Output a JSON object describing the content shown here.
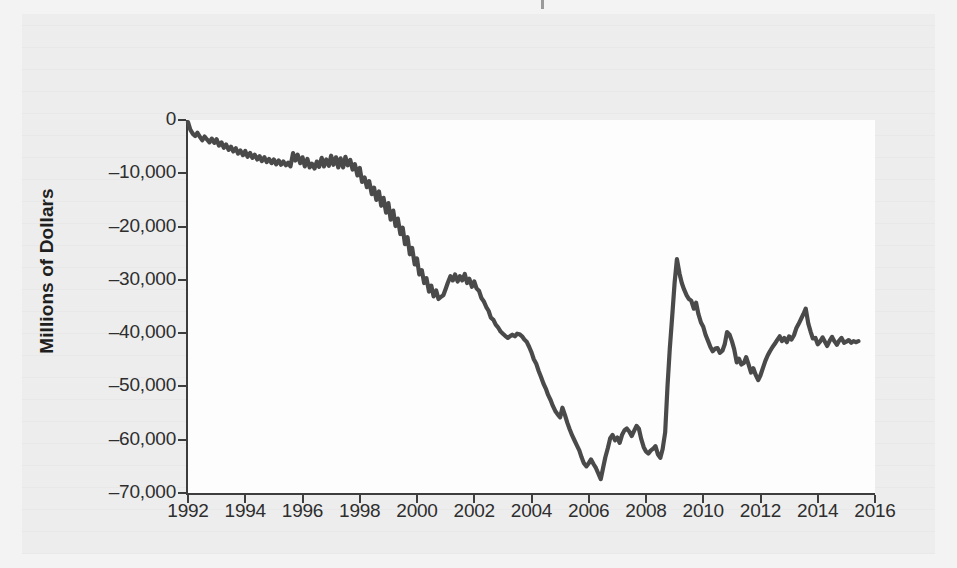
{
  "figure": {
    "background_color": "#ededed",
    "plot_background_color": "#fdfdfd",
    "line_color": "#4a4a4a",
    "axis_color": "#3d3d3d",
    "y_axis_title": "Millions of Dollars"
  },
  "axes": {
    "y_ticks": [
      "0",
      "–10,000",
      "–20,000",
      "–30,000",
      "–40,000",
      "–50,000",
      "–60,000",
      "–70,000"
    ],
    "x_ticks": [
      "1992",
      "1994",
      "1996",
      "1998",
      "2000",
      "2002",
      "2004",
      "2006",
      "2008",
      "2010",
      "2012",
      "2014",
      "2016"
    ]
  },
  "chart_data": {
    "type": "line",
    "title": "",
    "subtitle": "",
    "xlabel": "",
    "ylabel": "Millions of Dollars",
    "xlim": [
      1992,
      2016
    ],
    "ylim": [
      -70000,
      0
    ],
    "grid": false,
    "legend": null,
    "y_tick_values": [
      0,
      -10000,
      -20000,
      -30000,
      -40000,
      -50000,
      -60000,
      -70000
    ],
    "x_tick_values": [
      1992,
      1994,
      1996,
      1998,
      2000,
      2002,
      2004,
      2006,
      2008,
      2010,
      2012,
      2014,
      2016
    ],
    "series": [
      {
        "name": "Trade Balance",
        "x": [
          1992.0,
          1992.08,
          1992.17,
          1992.25,
          1992.33,
          1992.42,
          1992.5,
          1992.58,
          1992.67,
          1992.75,
          1992.83,
          1992.92,
          1993.0,
          1993.08,
          1993.17,
          1993.25,
          1993.33,
          1993.42,
          1993.5,
          1993.58,
          1993.67,
          1993.75,
          1993.83,
          1993.92,
          1994.0,
          1994.08,
          1994.17,
          1994.25,
          1994.33,
          1994.42,
          1994.5,
          1994.58,
          1994.67,
          1994.75,
          1994.83,
          1994.92,
          1995.0,
          1995.08,
          1995.17,
          1995.25,
          1995.33,
          1995.42,
          1995.5,
          1995.58,
          1995.67,
          1995.75,
          1995.83,
          1995.92,
          1996.0,
          1996.08,
          1996.17,
          1996.25,
          1996.33,
          1996.42,
          1996.5,
          1996.58,
          1996.67,
          1996.75,
          1996.83,
          1996.92,
          1997.0,
          1997.08,
          1997.17,
          1997.25,
          1997.33,
          1997.42,
          1997.5,
          1997.58,
          1997.67,
          1997.75,
          1997.83,
          1997.92,
          1998.0,
          1998.08,
          1998.17,
          1998.25,
          1998.33,
          1998.42,
          1998.5,
          1998.58,
          1998.67,
          1998.75,
          1998.83,
          1998.92,
          1999.0,
          1999.08,
          1999.17,
          1999.25,
          1999.33,
          1999.42,
          1999.5,
          1999.58,
          1999.67,
          1999.75,
          1999.83,
          1999.92,
          2000.0,
          2000.08,
          2000.17,
          2000.25,
          2000.33,
          2000.42,
          2000.5,
          2000.58,
          2000.67,
          2000.75,
          2000.83,
          2000.92,
          2001.0,
          2001.08,
          2001.17,
          2001.25,
          2001.33,
          2001.42,
          2001.5,
          2001.58,
          2001.67,
          2001.75,
          2001.83,
          2001.92,
          2002.0,
          2002.08,
          2002.17,
          2002.25,
          2002.33,
          2002.42,
          2002.5,
          2002.58,
          2002.67,
          2002.75,
          2002.83,
          2002.92,
          2003.0,
          2003.08,
          2003.17,
          2003.25,
          2003.33,
          2003.42,
          2003.5,
          2003.58,
          2003.67,
          2003.75,
          2003.83,
          2003.92,
          2004.0,
          2004.08,
          2004.17,
          2004.25,
          2004.33,
          2004.42,
          2004.5,
          2004.58,
          2004.67,
          2004.75,
          2004.83,
          2004.92,
          2005.0,
          2005.08,
          2005.17,
          2005.25,
          2005.33,
          2005.42,
          2005.5,
          2005.58,
          2005.67,
          2005.75,
          2005.83,
          2005.92,
          2006.0,
          2006.08,
          2006.17,
          2006.25,
          2006.33,
          2006.42,
          2006.5,
          2006.58,
          2006.67,
          2006.75,
          2006.83,
          2006.92,
          2007.0,
          2007.08,
          2007.17,
          2007.25,
          2007.33,
          2007.42,
          2007.5,
          2007.58,
          2007.67,
          2007.75,
          2007.83,
          2007.92,
          2008.0,
          2008.08,
          2008.17,
          2008.25,
          2008.33,
          2008.42,
          2008.5,
          2008.58,
          2008.67,
          2008.75,
          2008.83,
          2008.92,
          2009.0,
          2009.08,
          2009.17,
          2009.25,
          2009.33,
          2009.42,
          2009.5,
          2009.58,
          2009.67,
          2009.75,
          2009.83,
          2009.92,
          2010.0,
          2010.08,
          2010.17,
          2010.25,
          2010.33,
          2010.42,
          2010.5,
          2010.58,
          2010.67,
          2010.75,
          2010.83,
          2010.92,
          2011.0,
          2011.08,
          2011.17,
          2011.25,
          2011.33,
          2011.42,
          2011.5,
          2011.58,
          2011.67,
          2011.75,
          2011.83,
          2011.92,
          2012.0,
          2012.08,
          2012.17,
          2012.25,
          2012.33,
          2012.42,
          2012.5,
          2012.58,
          2012.67,
          2012.75,
          2012.83,
          2012.92,
          2013.0,
          2013.08,
          2013.17,
          2013.25,
          2013.33,
          2013.42,
          2013.5,
          2013.58,
          2013.67,
          2013.75,
          2013.83,
          2013.92,
          2014.0,
          2014.08,
          2014.17,
          2014.25,
          2014.33,
          2014.42,
          2014.5,
          2014.58,
          2014.67,
          2014.75,
          2014.83,
          2014.92,
          2015.0,
          2015.08,
          2015.17,
          2015.25,
          2015.33,
          2015.42
        ],
        "values": [
          -400,
          -1800,
          -2600,
          -3000,
          -2400,
          -3200,
          -3800,
          -3100,
          -3700,
          -4200,
          -3500,
          -4300,
          -3600,
          -4800,
          -4200,
          -5200,
          -4600,
          -5600,
          -5000,
          -5900,
          -5300,
          -6300,
          -5700,
          -6600,
          -5800,
          -6900,
          -6200,
          -7100,
          -6500,
          -7400,
          -6800,
          -7700,
          -7000,
          -7900,
          -7300,
          -8100,
          -7400,
          -8300,
          -7600,
          -8400,
          -7800,
          -8500,
          -8000,
          -8700,
          -6200,
          -7600,
          -6500,
          -8100,
          -7000,
          -8700,
          -7300,
          -8900,
          -8200,
          -9100,
          -7800,
          -8800,
          -7100,
          -8700,
          -7400,
          -8600,
          -6700,
          -8400,
          -7000,
          -8900,
          -7200,
          -8900,
          -6900,
          -8500,
          -7500,
          -9300,
          -8300,
          -10400,
          -9000,
          -11600,
          -10800,
          -12600,
          -11500,
          -13900,
          -12700,
          -15000,
          -13400,
          -16100,
          -14600,
          -17400,
          -15600,
          -18700,
          -17000,
          -19900,
          -18500,
          -21400,
          -20200,
          -23300,
          -22000,
          -25200,
          -24000,
          -27100,
          -26000,
          -29000,
          -28200,
          -30600,
          -29700,
          -32200,
          -31100,
          -33100,
          -32000,
          -33600,
          -33200,
          -32900,
          -31700,
          -30500,
          -29300,
          -30100,
          -29000,
          -30300,
          -29300,
          -30100,
          -28900,
          -30600,
          -29800,
          -31300,
          -30300,
          -31600,
          -32100,
          -33400,
          -34000,
          -35100,
          -35800,
          -37100,
          -37500,
          -38400,
          -38900,
          -39700,
          -40100,
          -40500,
          -40900,
          -40600,
          -40300,
          -40600,
          -40100,
          -40200,
          -40600,
          -41200,
          -41600,
          -42600,
          -43600,
          -44900,
          -45800,
          -47100,
          -48200,
          -49500,
          -50400,
          -51600,
          -52600,
          -53700,
          -54600,
          -55300,
          -55800,
          -54000,
          -55400,
          -56800,
          -58000,
          -59200,
          -60100,
          -61000,
          -62000,
          -63300,
          -64400,
          -65000,
          -64400,
          -63700,
          -64600,
          -65300,
          -66300,
          -67400,
          -65300,
          -63300,
          -61500,
          -59700,
          -59100,
          -60100,
          -59600,
          -60600,
          -59000,
          -58200,
          -57900,
          -58500,
          -59300,
          -58400,
          -57400,
          -57900,
          -59800,
          -61400,
          -62200,
          -62600,
          -62000,
          -61700,
          -61200,
          -62800,
          -63400,
          -61800,
          -58600,
          -50100,
          -43000,
          -36500,
          -30500,
          -26100,
          -28800,
          -30600,
          -31800,
          -32900,
          -33600,
          -33900,
          -35400,
          -34300,
          -36400,
          -38000,
          -38800,
          -40300,
          -41500,
          -42600,
          -43400,
          -42900,
          -42800,
          -43700,
          -43300,
          -42100,
          -39800,
          -40300,
          -41500,
          -43000,
          -45500,
          -44800,
          -45900,
          -45600,
          -44500,
          -45800,
          -47400,
          -46600,
          -47800,
          -48800,
          -47900,
          -46600,
          -45200,
          -44200,
          -43400,
          -42600,
          -42000,
          -41300,
          -40600,
          -41500,
          -40900,
          -41700,
          -40600,
          -41200,
          -40400,
          -39100,
          -38300,
          -37300,
          -36400,
          -35400,
          -38200,
          -39700,
          -41000,
          -40900,
          -42100,
          -41600,
          -40800,
          -41600,
          -42400,
          -41400,
          -40700,
          -41500,
          -42200,
          -41400,
          -40900,
          -41800,
          -41600,
          -41300,
          -41800,
          -41500,
          -41700,
          -41500
        ]
      }
    ]
  }
}
